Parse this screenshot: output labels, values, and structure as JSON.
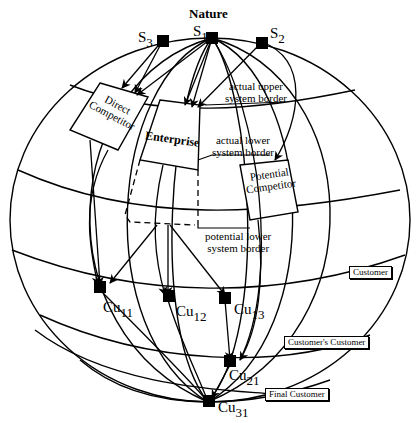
{
  "diagram": {
    "title": "Nature",
    "suppliers": [
      {
        "id": "S3",
        "label": "S",
        "sub": "3"
      },
      {
        "id": "S1",
        "label": "S",
        "sub": "1"
      },
      {
        "id": "S2",
        "label": "S",
        "sub": "2"
      }
    ],
    "entities": {
      "direct_competitor": "Direct Competitor",
      "direct_competitor_l1": "Direct",
      "direct_competitor_l2": "Competitor",
      "enterprise": "Enterprise",
      "potential_competitor_l1": "Potential",
      "potential_competitor_l2": "Competitor"
    },
    "borders": {
      "actual_upper_l1": "actual upper",
      "actual_upper_l2": "system border",
      "actual_lower_l1": "actual lower",
      "actual_lower_l2": "system border",
      "potential_lower_l1": "potential lower",
      "potential_lower_l2": "system border"
    },
    "customers": [
      {
        "id": "Cu11",
        "label": "Cu",
        "sub": "11"
      },
      {
        "id": "Cu12",
        "label": "Cu",
        "sub": "12"
      },
      {
        "id": "Cu13",
        "label": "Cu",
        "sub": "13"
      },
      {
        "id": "Cu21",
        "label": "Cu",
        "sub": "21"
      },
      {
        "id": "Cu31",
        "label": "Cu",
        "sub": "31"
      }
    ],
    "levels": {
      "customer": "Customer",
      "customers_customer": "Customer's Customer",
      "final_customer": "Final Customer"
    }
  }
}
